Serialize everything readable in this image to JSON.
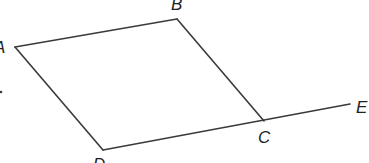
{
  "diagram": {
    "type": "geometry-figure",
    "points": {
      "A": {
        "label": "A",
        "x": 15,
        "y": 47,
        "label_x": -6,
        "label_y": 53
      },
      "B": {
        "label": "B",
        "x": 177,
        "y": 19,
        "label_x": 171,
        "label_y": 10
      },
      "C": {
        "label": "C",
        "x": 264,
        "y": 121,
        "label_x": 258,
        "label_y": 143
      },
      "D": {
        "label": "D",
        "x": 103,
        "y": 150,
        "label_x": 93,
        "label_y": 170
      },
      "E": {
        "label": "E",
        "x": 350,
        "y": 104,
        "label_x": 356,
        "label_y": 113
      }
    },
    "segments": [
      {
        "from": "A",
        "to": "B"
      },
      {
        "from": "B",
        "to": "C"
      },
      {
        "from": "A",
        "to": "D"
      },
      {
        "from": "D",
        "to": "E"
      }
    ],
    "stray_mark": {
      "x": 1,
      "y": 92
    },
    "colors": {
      "line": "#3a3a3a",
      "label": "#222222",
      "background": "#ffffff"
    }
  }
}
